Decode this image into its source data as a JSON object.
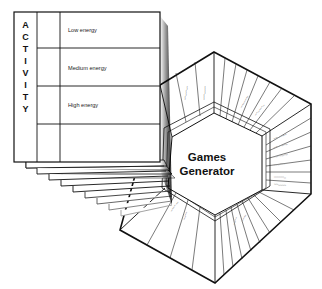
{
  "diagram": {
    "hub": {
      "title_line1": "Games",
      "title_line2": "Generator"
    },
    "card": {
      "side_label_letters": [
        "A",
        "C",
        "T",
        "I",
        "V",
        "I",
        "T",
        "Y"
      ],
      "rows": [
        {
          "label": "Low energy"
        },
        {
          "label": "Medium energy"
        },
        {
          "label": "High energy"
        },
        {
          "label": ""
        }
      ],
      "stacked_cards_count": 9
    },
    "hexagon_sectors": {
      "note": "Small radial sector labels are present but illegible at this resolution",
      "right_side_labels_partial": [
        "",
        "",
        "",
        "",
        "",
        ""
      ]
    },
    "colors": {
      "line": "#111111",
      "background": "#ffffff",
      "faint_text": "#9a9a9a"
    }
  }
}
